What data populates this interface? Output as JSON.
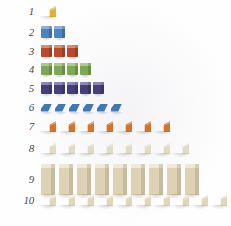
{
  "figure": {
    "background_color": "#fefefe",
    "label_color": "#4a4a4a"
  },
  "chart_data": {
    "type": "bar",
    "xlabel": "",
    "ylabel": "",
    "categories": [
      "1",
      "2",
      "3",
      "4",
      "5",
      "6",
      "7",
      "8",
      "9",
      "10"
    ],
    "values": [
      1,
      2,
      3,
      4,
      5,
      6,
      7,
      8,
      9,
      10
    ],
    "xlim": [
      0,
      10
    ],
    "grid": false,
    "legend": "none",
    "orientation": "horizontal",
    "note": "Each unit is drawn as one physical 3D block rather than a continuous bar."
  },
  "rows": [
    {
      "label": "1",
      "count": 1,
      "color": "#e3b233",
      "color_name": "gold",
      "shape": "wedge",
      "shape_name": "wedge-block"
    },
    {
      "label": "2",
      "count": 2,
      "color": "#4c82bd",
      "color_name": "medium-blue",
      "shape": "cube",
      "shape_name": "cube-block"
    },
    {
      "label": "3",
      "count": 3,
      "color": "#b84a2e",
      "color_name": "brick-red",
      "shape": "cube",
      "shape_name": "cube-block"
    },
    {
      "label": "4",
      "count": 4,
      "color": "#7fa854",
      "color_name": "olive-green",
      "shape": "cube",
      "shape_name": "cube-block"
    },
    {
      "label": "5",
      "count": 5,
      "color": "#463f7c",
      "color_name": "dark-indigo",
      "shape": "cube",
      "shape_name": "cube-block"
    },
    {
      "label": "6",
      "count": 6,
      "color": "#3f78b4",
      "color_name": "steel-blue",
      "shape": "tile",
      "shape_name": "flat-tile-block"
    },
    {
      "label": "7",
      "count": 7,
      "color": "#d4742c",
      "color_name": "orange",
      "shape": "wedge",
      "shape_name": "wedge-block"
    },
    {
      "label": "8",
      "count": 8,
      "color": "#e2dac2",
      "color_name": "cream",
      "shape": "wedge",
      "shape_name": "wedge-block"
    },
    {
      "label": "9",
      "count": 9,
      "color": "#ddd3b4",
      "color_name": "cream",
      "shape": "bar",
      "shape_name": "tall-bar-block"
    },
    {
      "label": "10",
      "count": 10,
      "color": "#e0d7bb",
      "color_name": "cream",
      "shape": "wedge",
      "shape_name": "wedge-block"
    }
  ],
  "layout": {
    "row_tops": [
      6,
      26,
      45,
      63,
      82,
      102,
      121,
      143,
      164,
      195
    ],
    "row_gaps": [
      0,
      2,
      2,
      2,
      2,
      3,
      4,
      4,
      4,
      4
    ],
    "blocks_left": 41
  }
}
